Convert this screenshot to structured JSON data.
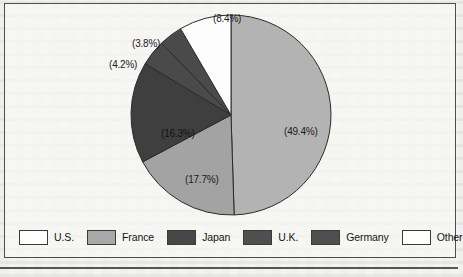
{
  "figure": {
    "type": "pie-chart-figure",
    "frame_border_color": "#4d4d4d",
    "background_color": "#f3f3f1"
  },
  "chart_data": {
    "type": "pie",
    "title": "",
    "subtitle": "",
    "xlabel": "",
    "ylabel": "",
    "grid": false,
    "legend_position": "bottom",
    "label_format": "(value%)",
    "start_angle_deg": 0,
    "direction": "clockwise",
    "categories": [
      "U.S.",
      "France",
      "Japan",
      "U.K.",
      "Germany",
      "Other"
    ],
    "values": [
      49.4,
      17.7,
      16.3,
      4.2,
      3.8,
      8.4
    ],
    "labels": [
      "(49.4%)",
      "(17.7%)",
      "(16.3%)",
      "(4.2%)",
      "(3.8%)",
      "(8.4%)"
    ],
    "colors": [
      "#b3b3b3",
      "#a3a3a3",
      "#3f3f3f",
      "#4a4a4a",
      "#4a4a4a",
      "#fdfdfd"
    ],
    "slices": [
      {
        "name": "U.S.",
        "value": 49.4,
        "label": "(49.4%)",
        "color": "#b3b3b3",
        "label_placement": "inside"
      },
      {
        "name": "France",
        "value": 17.7,
        "label": "(17.7%)",
        "color": "#a3a3a3",
        "label_placement": "inside"
      },
      {
        "name": "Japan",
        "value": 16.3,
        "label": "(16.3%)",
        "color": "#3f3f3f",
        "label_placement": "inside"
      },
      {
        "name": "U.K.",
        "value": 4.2,
        "label": "(4.2%)",
        "color": "#4a4a4a",
        "label_placement": "outside-leader"
      },
      {
        "name": "Germany",
        "value": 3.8,
        "label": "(3.8%)",
        "color": "#4a4a4a",
        "label_placement": "outside-leader"
      },
      {
        "name": "Other",
        "value": 8.4,
        "label": "(8.4%)",
        "color": "#fdfdfd",
        "label_placement": "outside-leader"
      }
    ]
  },
  "legend": {
    "items": [
      {
        "label": "U.S.",
        "color": "#ffffff"
      },
      {
        "label": "France",
        "color": "#a8a8a8"
      },
      {
        "label": "Japan",
        "color": "#474747"
      },
      {
        "label": "U.K.",
        "color": "#4f4f4f"
      },
      {
        "label": "Germany",
        "color": "#4f4f4f"
      },
      {
        "label": "Other",
        "color": "#ffffff"
      }
    ]
  }
}
